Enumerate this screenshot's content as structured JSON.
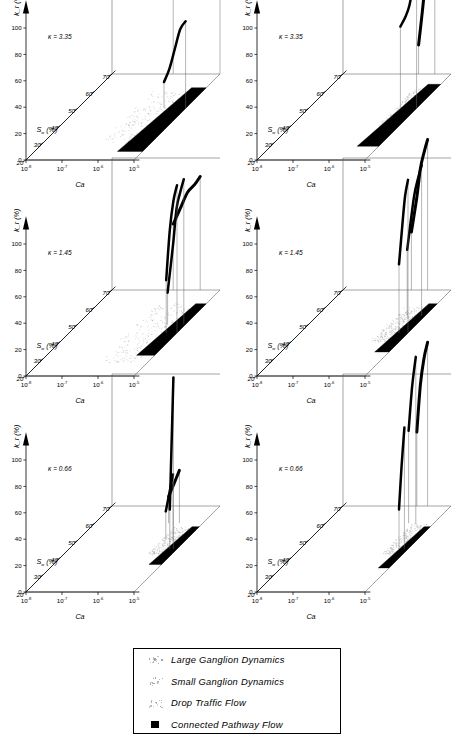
{
  "figure": {
    "type": "scientific-3d-surface-grid",
    "panel_count": 6,
    "rows": 3,
    "columns": 2
  },
  "axes": {
    "y_label": "k_r (%)",
    "y_ticks": [
      "0",
      "20",
      "40",
      "60",
      "80",
      "100"
    ],
    "y_values": [
      0,
      20,
      40,
      60,
      80,
      100
    ],
    "x_label": "Ca",
    "x_ticks": [
      {
        "mantissa": "10",
        "exponent": "-8"
      },
      {
        "mantissa": "10",
        "exponent": "-7"
      },
      {
        "mantissa": "10",
        "exponent": "-6"
      },
      {
        "mantissa": "10",
        "exponent": "-5"
      }
    ],
    "depth_label": "S_w (%)",
    "depth_label_base": "S",
    "depth_label_sub": "w",
    "depth_label_unit": "(%)",
    "depth_ticks": [
      "20",
      "30",
      "40",
      "50",
      "60",
      "70"
    ],
    "depth_values": [
      20,
      30,
      40,
      50,
      60,
      70
    ]
  },
  "panels": [
    {
      "id": "top-left",
      "kappa_label": "κ = 3.35",
      "kappa": 3.35,
      "column": "left"
    },
    {
      "id": "top-right",
      "kappa_label": "κ = 3.35",
      "kappa": 3.35,
      "column": "right"
    },
    {
      "id": "middle-left",
      "kappa_label": "κ = 1.45",
      "kappa": 1.45,
      "column": "left"
    },
    {
      "id": "middle-right",
      "kappa_label": "κ = 1.45",
      "kappa": 1.45,
      "column": "right"
    },
    {
      "id": "bottom-left",
      "kappa_label": "κ = 0.66",
      "kappa": 0.66,
      "column": "left"
    },
    {
      "id": "bottom-right",
      "kappa_label": "κ = 0.66",
      "kappa": 0.66,
      "column": "right"
    }
  ],
  "legend": {
    "items": [
      {
        "label": "Large Ganglion Dynamics",
        "marker": "faint-dots"
      },
      {
        "label": "Small Ganglion Dynamics",
        "marker": "faint-dots"
      },
      {
        "label": "Drop Traffic Flow",
        "marker": "faint-dots"
      },
      {
        "label": "Connected Pathway Flow",
        "marker": "filled-square"
      }
    ]
  },
  "colors": {
    "curve": "#000000",
    "axis": "#000000",
    "box": "#5a5a5a",
    "scatter_light": "#b8b8b8",
    "connected_pathway": "#000000",
    "background": "#ffffff"
  },
  "chart_data": {
    "type": "line",
    "title": "",
    "xlabel": "Ca",
    "ylabel": "k_r (%)",
    "zlabel": "S_w (%)",
    "xlim": [
      -8,
      -5
    ],
    "ylim": [
      0,
      100
    ],
    "zlim": [
      20,
      70
    ],
    "grid": false,
    "legend_position": "bottom-center",
    "note": "Six 3-D relative-permeability surfaces; each panel plots k_r versus capillary number Ca and water saturation S_w for a given viscosity ratio kappa. Heavy black ridges are the k_r curves, light stipple marks ganglion/drop-traffic regions and solid black bands mark connected pathway flow.",
    "panels": [
      {
        "id": "top-left",
        "kappa": 3.35,
        "series": [
          {
            "name": "Sw=70 ridge",
            "sw": 70,
            "x": [
              -6.3,
              -6.0,
              -5.7,
              -5.45,
              -5.3,
              -5.15,
              -5.0
            ],
            "y": [
              62,
              70,
              78,
              83,
              80,
              90,
              100
            ]
          },
          {
            "name": "Sw=50 ridge",
            "sw": 50,
            "x": [
              -5.6,
              -5.45,
              -5.3,
              -5.15,
              -5.0
            ],
            "y": [
              20,
              30,
              45,
              60,
              66
            ]
          }
        ],
        "regions": [
          {
            "name": "Drop Traffic Flow",
            "style": "faint-dots",
            "sw_range": [
              30,
              60
            ],
            "x_range": [
              -6.4,
              -5.2
            ]
          },
          {
            "name": "Connected Pathway Flow",
            "style": "filled",
            "sw_range": [
              25,
              62
            ],
            "x_range": [
              -5.7,
              -5.0
            ]
          }
        ]
      },
      {
        "id": "top-right",
        "kappa": 3.35,
        "series": [
          {
            "name": "Sw=70 ridge",
            "sw": 70,
            "x": [
              -5.9,
              -5.75,
              -5.65,
              -5.55,
              -5.45
            ],
            "y": [
              22,
              60,
              100,
              96,
              70
            ]
          },
          {
            "name": "Sw=50 ridge",
            "sw": 50,
            "x": [
              -5.45,
              -5.3,
              -5.2,
              -5.1,
              -5.0
            ],
            "y": [
              62,
              70,
              78,
              92,
              100
            ]
          }
        ],
        "regions": [
          {
            "name": "Drop Traffic Flow",
            "style": "faint-dots",
            "sw_range": [
              40,
              62
            ],
            "x_range": [
              -5.6,
              -5.2
            ]
          },
          {
            "name": "Connected Pathway Flow",
            "style": "filled",
            "sw_range": [
              28,
              64
            ],
            "x_range": [
              -5.6,
              -5.0
            ]
          }
        ]
      },
      {
        "id": "middle-left",
        "kappa": 1.45,
        "series": [
          {
            "name": "Sw=70 ridge",
            "sw": 70,
            "x": [
              -6.3,
              -6.1,
              -5.9,
              -5.7,
              -5.55
            ],
            "y": [
              50,
              62,
              74,
              80,
              86
            ]
          },
          {
            "name": "Sw=50 ridge",
            "sw": 50,
            "x": [
              -5.5,
              -5.35,
              -5.25,
              -5.15,
              -5.05
            ],
            "y": [
              24,
              60,
              88,
              100,
              110
            ]
          },
          {
            "name": "Sw=45 ridge",
            "sw": 45,
            "x": [
              -5.3,
              -5.2,
              -5.1,
              -5.0
            ],
            "y": [
              40,
              78,
              100,
              112
            ]
          }
        ],
        "regions": [
          {
            "name": "Drop Traffic Flow",
            "style": "faint-dots",
            "sw_range": [
              28,
              62
            ],
            "x_range": [
              -6.4,
              -5.2
            ]
          },
          {
            "name": "Connected Pathway Flow",
            "style": "filled",
            "sw_range": [
              32,
              62
            ],
            "x_range": [
              -5.5,
              -5.0
            ]
          }
        ]
      },
      {
        "id": "middle-right",
        "kappa": 1.45,
        "series": [
          {
            "name": "Sw=70 ridge",
            "sw": 70,
            "x": [
              -6.1,
              -5.95,
              -5.85,
              -5.75,
              -5.65
            ],
            "y": [
              44,
              70,
              92,
              104,
              114
            ]
          },
          {
            "name": "Sw=55 ridge",
            "sw": 55,
            "x": [
              -5.5,
              -5.4,
              -5.3,
              -5.2,
              -5.1
            ],
            "y": [
              50,
              72,
              92,
              104,
              114
            ]
          },
          {
            "name": "Sw=45 ridge",
            "sw": 45,
            "x": [
              -5.25,
              -5.15,
              -5.08,
              -5.0
            ],
            "y": [
              52,
              84,
              104,
              116
            ]
          }
        ],
        "regions": [
          {
            "name": "Drop Traffic Flow",
            "style": "faint-dots",
            "sw_range": [
              40,
              60
            ],
            "x_range": [
              -5.8,
              -5.3
            ]
          },
          {
            "name": "Connected Pathway Flow",
            "style": "filled",
            "sw_range": [
              34,
              62
            ],
            "x_range": [
              -5.4,
              -5.0
            ]
          }
        ]
      },
      {
        "id": "bottom-left",
        "kappa": 0.66,
        "series": [
          {
            "name": "Sw=60 band",
            "sw": 60,
            "x": [
              -5.95,
              -5.8,
              -5.65
            ],
            "y": [
              20,
              30,
              40
            ]
          },
          {
            "name": "Sw=50 band",
            "sw": 50,
            "x": [
              -5.55,
              -5.45,
              -5.35
            ],
            "y": [
              22,
              36,
              50
            ]
          },
          {
            "name": "Sw=45 spike",
            "sw": 45,
            "x": [
              -5.2,
              -5.15,
              -5.1
            ],
            "y": [
              30,
              80,
              130
            ]
          }
        ],
        "regions": [
          {
            "name": "Drop Traffic Flow",
            "style": "faint-dots",
            "sw_range": [
              42,
              58
            ],
            "x_range": [
              -5.7,
              -5.2
            ]
          },
          {
            "name": "Connected Pathway Flow",
            "style": "filled",
            "sw_range": [
              36,
              58
            ],
            "x_range": [
              -5.35,
              -5.0
            ]
          }
        ]
      },
      {
        "id": "bottom-right",
        "kappa": 0.66,
        "series": [
          {
            "name": "Sw=70 ridge",
            "sw": 70,
            "x": [
              -5.95,
              -5.85,
              -5.75,
              -5.65
            ],
            "y": [
              56,
              92,
              112,
              124
            ]
          },
          {
            "name": "Sw=60 ridge",
            "sw": 60,
            "x": [
              -5.7,
              -5.6,
              -5.5
            ],
            "y": [
              70,
              104,
              126
            ]
          },
          {
            "name": "Sw=45 spike",
            "sw": 45,
            "x": [
              -5.25,
              -5.18,
              -5.1
            ],
            "y": [
              30,
              62,
              92
            ]
          }
        ],
        "regions": [
          {
            "name": "Drop Traffic Flow",
            "style": "faint-dots",
            "sw_range": [
              42,
              60
            ],
            "x_range": [
              -5.6,
              -5.15
            ]
          },
          {
            "name": "Connected Pathway Flow",
            "style": "filled",
            "sw_range": [
              34,
              58
            ],
            "x_range": [
              -5.3,
              -5.0
            ]
          }
        ]
      }
    ]
  }
}
